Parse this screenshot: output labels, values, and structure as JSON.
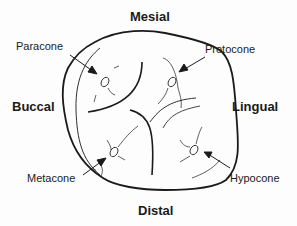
{
  "diagram": {
    "directions": {
      "top": "Mesial",
      "bottom": "Distal",
      "left": "Buccal",
      "right": "Lingual"
    },
    "cusps": [
      {
        "name": "Paracone",
        "position": "mesiobuccal"
      },
      {
        "name": "Protocone",
        "position": "mesiolingual"
      },
      {
        "name": "Metacone",
        "position": "distobuccal"
      },
      {
        "name": "Hypocone",
        "position": "distolingual"
      }
    ],
    "annotation_small": "b",
    "colors": {
      "line": "#1a1a1a",
      "background": "#fdfdfd"
    }
  }
}
